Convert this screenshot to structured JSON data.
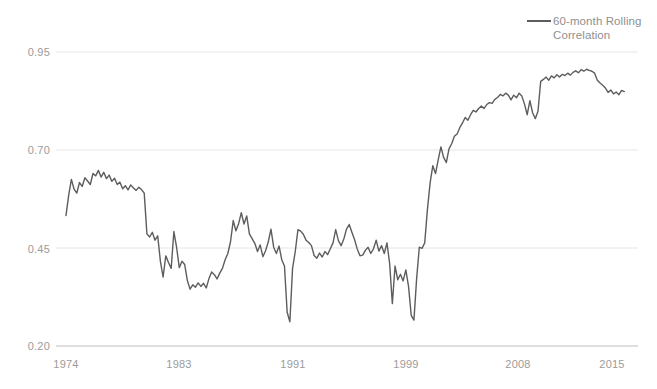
{
  "chart_data": {
    "type": "line",
    "title": "",
    "subtitle": "",
    "xlabel": "",
    "ylabel": "",
    "xlim": [
      1974,
      2015.6
    ],
    "ylim": [
      0.2,
      0.95
    ],
    "grid": true,
    "grid_axis": "y",
    "legend_position": "top-right",
    "line_color": "#5d5d5d",
    "grid_color": "#e6e6e6",
    "axis_label_color": "#9b9b9b",
    "background_color": "#ffffff",
    "y_ticks": [
      0.2,
      0.45,
      0.7,
      0.95
    ],
    "y_tick_labels": [
      "0.20",
      "0.45",
      "0.70",
      "0.95"
    ],
    "x_ticks": [
      1974,
      1983,
      1991,
      1999,
      2008,
      2015
    ],
    "x_tick_labels": [
      "1974",
      "1983",
      "1991",
      "1999",
      "2008",
      "2015"
    ],
    "series": [
      {
        "name": "60-month Rolling Correlation",
        "x": [
          1974.0,
          1974.2,
          1974.4,
          1974.6,
          1974.8,
          1975.0,
          1975.2,
          1975.4,
          1975.6,
          1975.8,
          1976.0,
          1976.2,
          1976.4,
          1976.6,
          1976.8,
          1977.0,
          1977.2,
          1977.4,
          1977.6,
          1977.8,
          1978.0,
          1978.2,
          1978.4,
          1978.6,
          1978.8,
          1979.0,
          1979.2,
          1979.4,
          1979.6,
          1979.8,
          1980.0,
          1980.2,
          1980.4,
          1980.6,
          1980.8,
          1981.0,
          1981.2,
          1981.4,
          1981.6,
          1981.8,
          1982.0,
          1982.2,
          1982.4,
          1982.6,
          1982.8,
          1983.0,
          1983.2,
          1983.4,
          1983.6,
          1983.8,
          1984.0,
          1984.2,
          1984.4,
          1984.6,
          1984.8,
          1985.0,
          1985.2,
          1985.4,
          1985.6,
          1985.8,
          1986.0,
          1986.2,
          1986.4,
          1986.6,
          1986.8,
          1987.0,
          1987.2,
          1987.4,
          1987.6,
          1987.8,
          1988.0,
          1988.2,
          1988.4,
          1988.6,
          1988.8,
          1989.0,
          1989.2,
          1989.4,
          1989.6,
          1989.8,
          1990.0,
          1990.2,
          1990.4,
          1990.6,
          1990.8,
          1991.0,
          1991.2,
          1991.4,
          1991.6,
          1991.8,
          1992.0,
          1992.2,
          1992.4,
          1992.6,
          1992.8,
          1993.0,
          1993.2,
          1993.4,
          1993.6,
          1993.8,
          1994.0,
          1994.2,
          1994.4,
          1994.6,
          1994.8,
          1995.0,
          1995.2,
          1995.4,
          1995.6,
          1995.8,
          1996.0,
          1996.2,
          1996.4,
          1996.6,
          1996.8,
          1997.0,
          1997.2,
          1997.4,
          1997.6,
          1997.8,
          1998.0,
          1998.2,
          1998.4,
          1998.6,
          1998.8,
          1999.0,
          1999.2,
          1999.4,
          1999.6,
          1999.8,
          2000.0,
          2000.2,
          2000.4,
          2000.6,
          2000.8,
          2001.0,
          2001.2,
          2001.4,
          2001.6,
          2001.8,
          2002.0,
          2002.2,
          2002.4,
          2002.6,
          2002.8,
          2003.0,
          2003.2,
          2003.4,
          2003.6,
          2003.8,
          2004.0,
          2004.2,
          2004.4,
          2004.6,
          2004.8,
          2005.0,
          2005.2,
          2005.4,
          2005.6,
          2005.8,
          2006.0,
          2006.2,
          2006.4,
          2006.6,
          2006.8,
          2007.0,
          2007.2,
          2007.4,
          2007.6,
          2007.8,
          2008.0,
          2008.2,
          2008.4,
          2008.6,
          2008.8,
          2009.0,
          2009.2,
          2009.4,
          2009.6,
          2009.8,
          2010.0,
          2010.2,
          2010.4,
          2010.6,
          2010.8,
          2011.0,
          2011.2,
          2011.4,
          2011.6,
          2011.8,
          2012.0,
          2012.2,
          2012.4,
          2012.6,
          2012.8,
          2013.0,
          2013.2,
          2013.4,
          2013.6,
          2013.8,
          2014.0,
          2014.2,
          2014.4,
          2014.6,
          2014.8,
          2015.0,
          2015.2,
          2015.4
        ],
        "values": [
          0.533,
          0.585,
          0.625,
          0.6,
          0.59,
          0.617,
          0.607,
          0.629,
          0.621,
          0.612,
          0.64,
          0.634,
          0.648,
          0.631,
          0.643,
          0.627,
          0.636,
          0.62,
          0.628,
          0.612,
          0.618,
          0.601,
          0.609,
          0.598,
          0.611,
          0.603,
          0.597,
          0.605,
          0.599,
          0.59,
          0.486,
          0.478,
          0.49,
          0.47,
          0.481,
          0.416,
          0.376,
          0.43,
          0.413,
          0.398,
          0.492,
          0.452,
          0.4,
          0.416,
          0.408,
          0.367,
          0.345,
          0.356,
          0.35,
          0.361,
          0.352,
          0.36,
          0.348,
          0.372,
          0.389,
          0.382,
          0.371,
          0.386,
          0.398,
          0.42,
          0.436,
          0.466,
          0.52,
          0.494,
          0.512,
          0.54,
          0.511,
          0.532,
          0.486,
          0.474,
          0.462,
          0.441,
          0.458,
          0.428,
          0.443,
          0.466,
          0.498,
          0.452,
          0.436,
          0.455,
          0.42,
          0.404,
          0.286,
          0.262,
          0.398,
          0.441,
          0.497,
          0.493,
          0.485,
          0.47,
          0.464,
          0.456,
          0.431,
          0.424,
          0.437,
          0.427,
          0.441,
          0.433,
          0.448,
          0.463,
          0.497,
          0.469,
          0.456,
          0.473,
          0.498,
          0.51,
          0.49,
          0.471,
          0.447,
          0.43,
          0.432,
          0.444,
          0.452,
          0.436,
          0.448,
          0.47,
          0.442,
          0.456,
          0.436,
          0.463,
          0.41,
          0.308,
          0.404,
          0.369,
          0.383,
          0.366,
          0.394,
          0.352,
          0.278,
          0.266,
          0.372,
          0.452,
          0.449,
          0.463,
          0.548,
          0.616,
          0.66,
          0.64,
          0.675,
          0.708,
          0.681,
          0.668,
          0.703,
          0.716,
          0.735,
          0.741,
          0.757,
          0.769,
          0.783,
          0.776,
          0.79,
          0.801,
          0.797,
          0.806,
          0.812,
          0.806,
          0.816,
          0.821,
          0.819,
          0.829,
          0.834,
          0.842,
          0.838,
          0.845,
          0.84,
          0.828,
          0.84,
          0.833,
          0.845,
          0.838,
          0.817,
          0.79,
          0.826,
          0.795,
          0.78,
          0.799,
          0.875,
          0.88,
          0.886,
          0.878,
          0.889,
          0.884,
          0.892,
          0.886,
          0.893,
          0.89,
          0.896,
          0.891,
          0.898,
          0.902,
          0.897,
          0.905,
          0.901,
          0.906,
          0.903,
          0.901,
          0.896,
          0.878,
          0.871,
          0.865,
          0.858,
          0.847,
          0.853,
          0.843,
          0.848,
          0.841,
          0.852,
          0.849
        ]
      }
    ],
    "legend": [
      {
        "label_line1": "60-month Rolling",
        "label_line2": "Correlation",
        "color": "#5d5d5d"
      }
    ]
  },
  "legend": {
    "line1": "60-month Rolling",
    "line2": "Correlation"
  },
  "axes": {
    "y_labels": [
      "0.95",
      "0.70",
      "0.45",
      "0.20"
    ],
    "x_labels": [
      "1974",
      "1983",
      "1991",
      "1999",
      "2008",
      "2015"
    ]
  }
}
